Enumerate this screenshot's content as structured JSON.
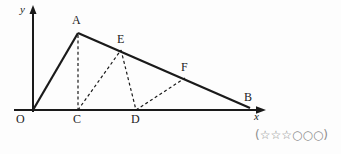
{
  "figure": {
    "type": "geometry-diagram",
    "axes": {
      "x_label": "x",
      "y_label": "y",
      "origin_label": "O"
    },
    "points": [
      {
        "name": "O",
        "label": "O",
        "x": 33,
        "y": 110,
        "label_x": 16,
        "label_y": 113
      },
      {
        "name": "A",
        "label": "A",
        "x": 78,
        "y": 33,
        "label_x": 72,
        "label_y": 14
      },
      {
        "name": "B",
        "label": "B",
        "x": 250,
        "y": 108,
        "label_x": 244,
        "label_y": 91
      },
      {
        "name": "C",
        "label": "C",
        "x": 78,
        "y": 110,
        "label_x": 73,
        "label_y": 113
      },
      {
        "name": "D",
        "label": "D",
        "x": 136,
        "y": 110,
        "label_x": 131,
        "label_y": 113
      },
      {
        "name": "E",
        "label": "E",
        "x": 121,
        "y": 50,
        "label_x": 117,
        "label_y": 33
      },
      {
        "name": "F",
        "label": "F",
        "x": 185,
        "y": 78,
        "label_x": 181,
        "label_y": 61
      }
    ],
    "solid_segments": [
      {
        "name": "segment-OA",
        "from": "O",
        "to": "A"
      },
      {
        "name": "segment-AB",
        "from": "A",
        "to": "B"
      }
    ],
    "dashed_segments": [
      {
        "name": "segment-AC",
        "from": "A",
        "to": "C"
      },
      {
        "name": "segment-CE",
        "from": "C",
        "to": "E"
      },
      {
        "name": "segment-ED",
        "from": "E",
        "to": "D"
      },
      {
        "name": "segment-DF",
        "from": "D",
        "to": "F"
      }
    ],
    "stroke_color": "#1a1a1a",
    "axis_color": "#1a1a1a"
  },
  "rating": {
    "text": "(☆☆☆○○○)",
    "filled_label": "star",
    "empty_label": "circle",
    "filled_count": 3,
    "empty_count": 3,
    "color": "#8c8c8c"
  }
}
